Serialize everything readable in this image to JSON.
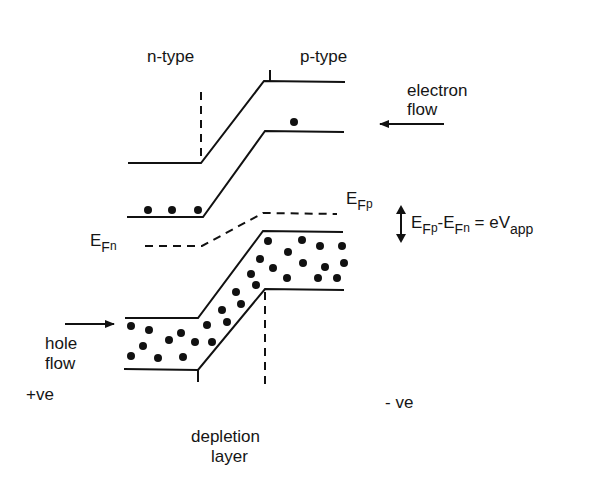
{
  "labels": {
    "n_type": "n-type",
    "p_type": "p-type",
    "electron_flow_line1": "electron",
    "electron_flow_line2": "flow",
    "hole_flow_line1": "hole",
    "hole_flow_line2": "flow",
    "positive": "+ve",
    "negative": "- ve",
    "depletion_line1": "depletion",
    "depletion_line2": "layer",
    "efp_main": "E",
    "efp_sub": "F",
    "efp_subsub": "p",
    "efn_main": "E",
    "efn_sub": "F",
    "efn_subsub": "n",
    "eq_e1": "E",
    "eq_f1": "F",
    "eq_p1": "p",
    "eq_minus": "-E",
    "eq_f2": "F",
    "eq_n2": "n",
    "eq_equals": " = eV",
    "eq_app": "app"
  },
  "colors": {
    "line": "#111111",
    "background": "#ffffff"
  }
}
